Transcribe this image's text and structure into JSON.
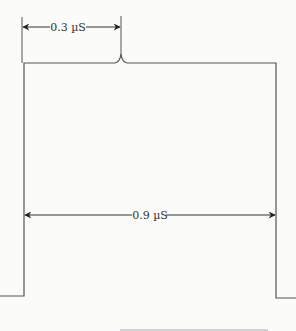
{
  "diagram": {
    "type": "pulse-timing",
    "labels": {
      "top_dimension": "0.3 µS",
      "middle_dimension": "0.9 µS"
    },
    "colors": {
      "line": "#555555",
      "arrow": "#222222",
      "background": "#fbfbfa"
    }
  }
}
